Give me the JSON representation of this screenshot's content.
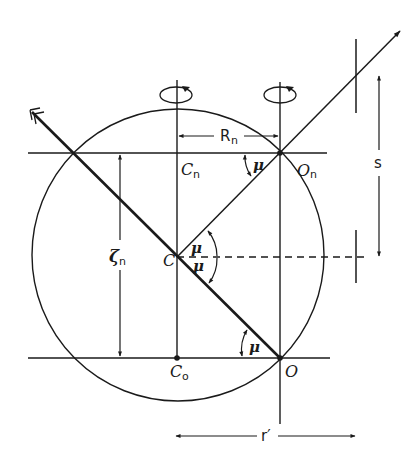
{
  "diagram": {
    "type": "geometric-optics",
    "labels": {
      "Cn": {
        "main": "C",
        "sub": "n"
      },
      "On": {
        "main": "O",
        "sub": "n"
      },
      "C": {
        "main": "C"
      },
      "Co": {
        "main": "C",
        "sub": "o"
      },
      "O": {
        "main": "O"
      },
      "Rn": {
        "main": "R",
        "sub": "n"
      },
      "zeta_n": {
        "main": "ζ",
        "sub": "n"
      },
      "s": {
        "main": "s"
      },
      "r_prime": {
        "main": "r′"
      },
      "mu_top": "μ",
      "mu_center_upper": "μ",
      "mu_center_lower": "μ",
      "mu_bottom": "μ"
    },
    "colors": {
      "stroke": "#1a1a1a",
      "background": "#ffffff"
    }
  }
}
